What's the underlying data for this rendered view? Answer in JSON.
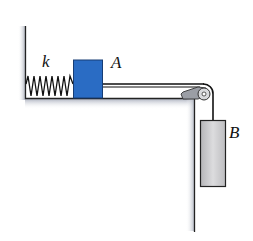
{
  "diagram": {
    "labels": {
      "spring": "k",
      "block_a": "A",
      "block_b": "B"
    },
    "colors": {
      "block_a": "#2a6cc4",
      "block_b": "#c8c8c8",
      "surface_shadow": "#b8bcc8",
      "line": "#111111"
    }
  }
}
